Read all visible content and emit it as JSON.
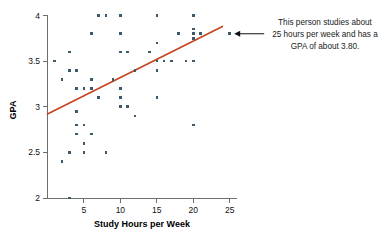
{
  "chart_data": {
    "type": "scatter",
    "title": "",
    "xlabel": "Study Hours per Week",
    "ylabel": "GPA",
    "xlim": [
      0,
      26
    ],
    "ylim": [
      2,
      4
    ],
    "xticks": [
      5,
      10,
      15,
      20,
      25
    ],
    "xtick_labels": [
      "5",
      "10",
      "15",
      "20",
      "25"
    ],
    "yticks": [
      2,
      2.5,
      3,
      3.5,
      4
    ],
    "ytick_labels": [
      "2",
      "2.5",
      "3",
      "3.5",
      "4"
    ],
    "grid": false,
    "legend": "none",
    "point_color": "#3d5a6c",
    "trendline_color": "#c0451f",
    "points": [
      {
        "x": 1,
        "y": 3.5
      },
      {
        "x": 2,
        "y": 3.3
      },
      {
        "x": 2,
        "y": 2.4
      },
      {
        "x": 3,
        "y": 3.6
      },
      {
        "x": 3,
        "y": 3.4
      },
      {
        "x": 3,
        "y": 2.5
      },
      {
        "x": 3,
        "y": 2.0
      },
      {
        "x": 4,
        "y": 3.4
      },
      {
        "x": 4,
        "y": 3.2
      },
      {
        "x": 4,
        "y": 2.95
      },
      {
        "x": 4,
        "y": 2.8
      },
      {
        "x": 4,
        "y": 2.7
      },
      {
        "x": 5,
        "y": 3.2
      },
      {
        "x": 5,
        "y": 2.8
      },
      {
        "x": 5,
        "y": 2.6
      },
      {
        "x": 5,
        "y": 2.5
      },
      {
        "x": 6,
        "y": 3.8
      },
      {
        "x": 6,
        "y": 3.3
      },
      {
        "x": 6,
        "y": 3.2
      },
      {
        "x": 6,
        "y": 2.7
      },
      {
        "x": 7,
        "y": 4.0
      },
      {
        "x": 7,
        "y": 3.1
      },
      {
        "x": 8,
        "y": 4.0
      },
      {
        "x": 8,
        "y": 2.5
      },
      {
        "x": 9,
        "y": 3.3
      },
      {
        "x": 10,
        "y": 4.0
      },
      {
        "x": 10,
        "y": 3.8
      },
      {
        "x": 10,
        "y": 3.6
      },
      {
        "x": 10,
        "y": 3.2
      },
      {
        "x": 10,
        "y": 3.1
      },
      {
        "x": 10,
        "y": 3.0
      },
      {
        "x": 11,
        "y": 3.6
      },
      {
        "x": 11,
        "y": 3.0
      },
      {
        "x": 12,
        "y": 3.4
      },
      {
        "x": 12,
        "y": 3.4
      },
      {
        "x": 12,
        "y": 2.9
      },
      {
        "x": 14,
        "y": 3.6
      },
      {
        "x": 15,
        "y": 4.0
      },
      {
        "x": 15,
        "y": 3.7
      },
      {
        "x": 15,
        "y": 3.5
      },
      {
        "x": 15,
        "y": 3.4
      },
      {
        "x": 15,
        "y": 3.1
      },
      {
        "x": 16,
        "y": 3.5
      },
      {
        "x": 17,
        "y": 3.5
      },
      {
        "x": 18,
        "y": 3.8
      },
      {
        "x": 19,
        "y": 3.5
      },
      {
        "x": 20,
        "y": 4.0
      },
      {
        "x": 20,
        "y": 3.85
      },
      {
        "x": 20,
        "y": 3.8
      },
      {
        "x": 20,
        "y": 3.75
      },
      {
        "x": 20,
        "y": 3.5
      },
      {
        "x": 20,
        "y": 2.8
      },
      {
        "x": 21,
        "y": 3.8
      },
      {
        "x": 25,
        "y": 3.8
      }
    ],
    "trendline": {
      "x_start": 0,
      "y_start": 2.92,
      "x_end": 24,
      "y_end": 3.88
    },
    "annotation": {
      "lines": [
        "This person studies about",
        "25 hours per week and has a",
        "GPA of about 3.80."
      ],
      "target_point": {
        "x": 25,
        "y": 3.8
      },
      "arrow": "arrow-left"
    }
  }
}
